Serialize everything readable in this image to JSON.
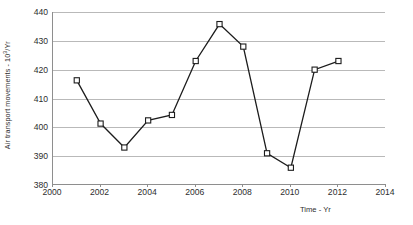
{
  "chart_data": {
    "type": "line",
    "title": "",
    "xlabel": "Time - Yr",
    "ylabel": "Air transport movements - 10³/Yr",
    "ylabel_prefix": "Air transport movements - 10",
    "ylabel_exponent": "3",
    "ylabel_suffix": "/Yr",
    "x": [
      2001,
      2002,
      2003,
      2004,
      2005,
      2006,
      2007,
      2008,
      2009,
      2010,
      2011,
      2012
    ],
    "values": [
      416.3,
      401.3,
      393.0,
      402.4,
      404.3,
      423.0,
      435.8,
      428.0,
      391.0,
      386.0,
      420.0,
      423.0
    ],
    "series": [
      {
        "name": "Air transport movements",
        "values": [
          416.3,
          401.3,
          393.0,
          402.4,
          404.3,
          423.0,
          435.8,
          428.0,
          391.0,
          386.0,
          420.0,
          423.0
        ]
      }
    ],
    "xlim": [
      2000,
      2014
    ],
    "ylim": [
      380,
      440
    ],
    "xticks": [
      2000,
      2002,
      2004,
      2006,
      2008,
      2010,
      2012,
      2014
    ],
    "xtick_labels": [
      "2000",
      "2002",
      "2004",
      "2006",
      "2008",
      "2010",
      "2012",
      "2014"
    ],
    "yticks": [
      380,
      390,
      400,
      410,
      420,
      430,
      440
    ],
    "ytick_labels": [
      "380",
      "390",
      "400",
      "410",
      "420",
      "430",
      "440"
    ],
    "grid": "horizontal",
    "legend": "none",
    "marker": "open-square",
    "line_color": "#1c1c1c",
    "marker_fill": "#ffffff",
    "grid_color": "#b9b9b9",
    "axis_color": "#8e8e8e",
    "background": "#ffffff"
  }
}
